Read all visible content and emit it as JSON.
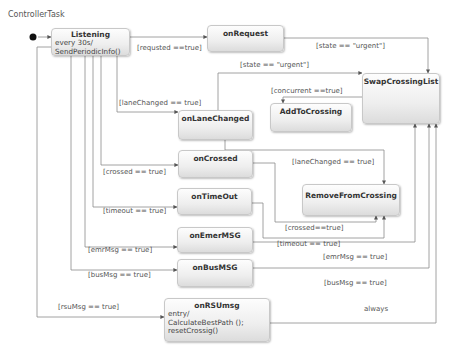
{
  "diagram": {
    "title": "ControllerTask",
    "states": {
      "listening": {
        "name": "Listening",
        "body_line1": "every 30s/",
        "body_line2": "SendPeriodicInfo()"
      },
      "on_request": {
        "name": "onRequest"
      },
      "swap_crossing_list": {
        "name": "SwapCrossingList"
      },
      "on_lane_changed": {
        "name": "onLaneChanged"
      },
      "add_to_crossing": {
        "name": "AddToCrossing"
      },
      "on_crossed": {
        "name": "onCrossed"
      },
      "remove_from_crossing": {
        "name": "RemoveFromCrossing"
      },
      "on_timeout": {
        "name": "onTimeOut"
      },
      "on_emer_msg": {
        "name": "onEmerMSG"
      },
      "on_bus_msg": {
        "name": "onBusMSG"
      },
      "on_rsu_msg": {
        "name": "onRSUmsg",
        "body_line1": "entry/",
        "body_line2": "CalculateBestPath ();",
        "body_line3": "resetCrossig()"
      }
    },
    "transitions": {
      "requested": "[requsted ==true]",
      "request_urgent": "[state == \"urgent\"]",
      "lane_urgent": "[state == \"urgent\"]",
      "lane_changed_in": "[laneChanged == true]",
      "concurrent": "[concurrent ==true]",
      "lane_changed_remove": "[laneChanged == true]",
      "crossed_in": "[crossed == true]",
      "crossed_remove": "[crossed==true]",
      "timeout_in": "[timeout == true]",
      "timeout_remove": "[timeout == true]",
      "emr_in": "[emrMsg == true]",
      "emr_swap": "[emrMsg == true]",
      "bus_in": "[busMsg == true]",
      "bus_swap": "[busMsg == true]",
      "rsu_in": "[rsuMsg == true]",
      "always": "always"
    }
  }
}
